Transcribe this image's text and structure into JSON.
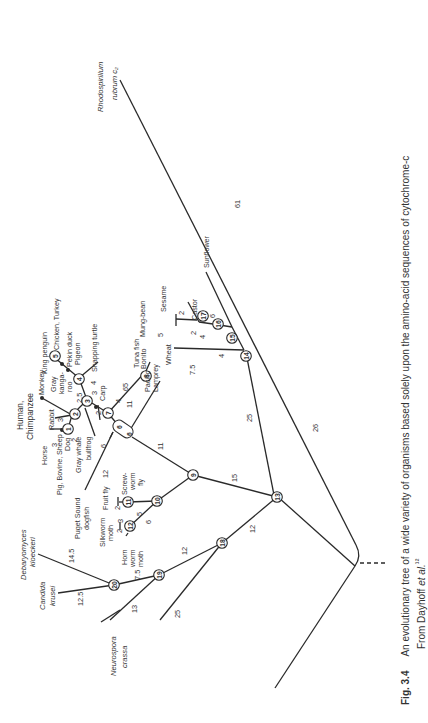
{
  "figure": {
    "number": "Fig. 3.4",
    "caption": "An evolutionary tree of a wide variety of organisms based solely upon the amino-acid sequences of cytochrome-c",
    "source_prefix": "From Dayhoff ",
    "source_italic": "et al.",
    "source_ref": "¹²"
  },
  "taxa": {
    "rhodospirillum_1": "Rhodospirillum",
    "rhodospirillum_2": "rubrum c₂",
    "sunflower": "Sunflower",
    "castor": "Castor",
    "sesame": "Sesame",
    "mung_bean": "Mung-bean",
    "wheat": "Wheat",
    "pacific_lamprey_1": "Pacific",
    "pacific_lamprey_2": "Lamprey",
    "bonito": "Bonito",
    "tuna_fish": "Tuna fish",
    "carp": "Carp",
    "snapping_turtle": "Snapping turtle",
    "pigeon": "Pigeon",
    "pekin_duck": "Pekin duck",
    "chicken_turkey": "Chicken, Turkey",
    "king_penguin": "King penguin",
    "gray_kangaroo_1": "Gray",
    "gray_kangaroo_2": "kanga-",
    "gray_kangaroo_3": "roo",
    "monkey": "Monkey",
    "human_1": "Human,",
    "human_2": "Chimpanzee",
    "rabbit": "Rabbit",
    "horse": "Horse",
    "sheep": "Sheep",
    "dog": "Dog",
    "pig_bovine": "Pig, Bovine,",
    "gray_whale": "Gray whale",
    "bullfrog": "bullfrog",
    "dogfish_1": "Puget Sound",
    "dogfish_2": "dogfish",
    "fruit_fly": "Fruit fly",
    "screwworm_1": "Screw-",
    "screwworm_2": "worm",
    "screwworm_3": "fly",
    "silkworm_1": "Silkworm",
    "silkworm_2": "moth",
    "hornworm_1": "Horn",
    "hornworm_2": "worm",
    "hornworm_3": "moth",
    "debaryomyces_1": "Debaryomyces",
    "debaryomyces_2": "kloeckeri",
    "candida_1": "Candida",
    "candida_2": "krusei",
    "neurospora_1": "Neurospora",
    "neurospora_2": "crassa"
  },
  "nodes": [
    "1",
    "2",
    "3",
    "4",
    "5",
    "6",
    "7",
    "8",
    "9",
    "10",
    "11",
    "12",
    "13",
    "14",
    "15",
    "16",
    "17",
    "18",
    "19",
    "20"
  ],
  "branch_lengths": {
    "root_rhodo": "61",
    "root_13": "26",
    "n13_14": "25",
    "n14_wheat": "7.5",
    "n14_15": "4",
    "n15_16": "4",
    "n15_sunflower": "6",
    "n16_castor_n17": "2",
    "n17_mung": "5",
    "n17_sesame": "2",
    "n13_9": "15",
    "n9_6": "11",
    "n6_lamprey": "11",
    "n6_7": "4",
    "n7_8": "65",
    "n7_3": "2",
    "n3_4": "3",
    "n4_birds": "4",
    "n3_2": "2.5",
    "n2_human": "3",
    "n1_horse": "3",
    "n1_dog": "2",
    "n6_bullfrog": "6",
    "n6_dogfish": "12",
    "n9_10": "10",
    "n10_11": "5",
    "n11_fruitfly": "2",
    "n10_12": "6",
    "n12_silkworm": "3",
    "n12_hornworm": "2",
    "n13_18": "12",
    "n18_19": "12",
    "n18_neurospora": "25",
    "n19_20": "7.5",
    "n19_candida_branch": "13",
    "n20_debaryomyces": "14.5",
    "n20_candida": "12.5"
  }
}
